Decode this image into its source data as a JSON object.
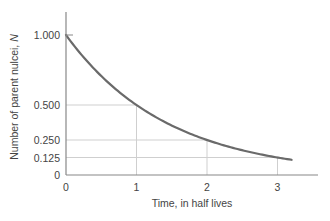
{
  "chart_data": {
    "type": "line",
    "title": "",
    "xlabel": "Time, in half lives",
    "ylabel_prefix": "Number of parent nulcei, ",
    "ylabel_var": "N",
    "xlim": [
      0,
      3.5
    ],
    "ylim": [
      0,
      1.15
    ],
    "x_ticks": [
      0,
      1,
      2,
      3
    ],
    "x_tick_labels": [
      "0",
      "1",
      "2",
      "3"
    ],
    "y_ticks": [
      0,
      0.125,
      0.25,
      0.5,
      1.0
    ],
    "y_tick_labels": [
      "0",
      "0.125",
      "0.250",
      "0.500",
      "1.000"
    ],
    "series": [
      {
        "name": "N(t) = N0 (1/2)^t",
        "x": [
          0,
          0.5,
          1,
          1.5,
          2,
          2.5,
          3,
          3.2
        ],
        "values": [
          1.0,
          0.707,
          0.5,
          0.354,
          0.25,
          0.177,
          0.125,
          0.109
        ],
        "color": "#666666"
      }
    ],
    "reference_lines": [
      {
        "x": 1,
        "y": 0.5
      },
      {
        "x": 2,
        "y": 0.25
      },
      {
        "x": 3,
        "y": 0.125
      }
    ],
    "grid": false,
    "legend": "none"
  }
}
